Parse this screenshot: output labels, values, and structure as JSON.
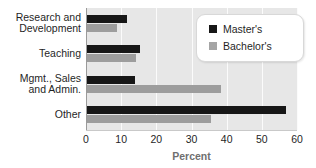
{
  "chart_data": {
    "type": "bar",
    "orientation": "horizontal",
    "title": "",
    "xlabel": "Percent",
    "ylabel": "",
    "xlim": [
      0,
      60
    ],
    "xticks": [
      0,
      10,
      20,
      30,
      40,
      50,
      60
    ],
    "grid": true,
    "grid_axis": "x",
    "legend_position": "top-right",
    "categories": [
      "Research and\nDevelopment",
      "Teaching",
      "Mgmt., Sales\nand Admin.",
      "Other"
    ],
    "series": [
      {
        "name": "Master's",
        "color": "#171717",
        "values": [
          11.6,
          15.4,
          13.9,
          57.0
        ]
      },
      {
        "name": "Bachelor's",
        "color": "#9d9d9d",
        "values": [
          8.8,
          14.2,
          38.5,
          35.5
        ]
      }
    ]
  },
  "title_sliver": "",
  "colors": {
    "plot_background": "#e7e7e7",
    "gridline": "#fbfbfb",
    "axis": "#9a9a9a",
    "master": "#171717",
    "bachelor": "#9d9d9d",
    "text": "#1f1f1f",
    "axis_title": "#6f6f6f"
  }
}
